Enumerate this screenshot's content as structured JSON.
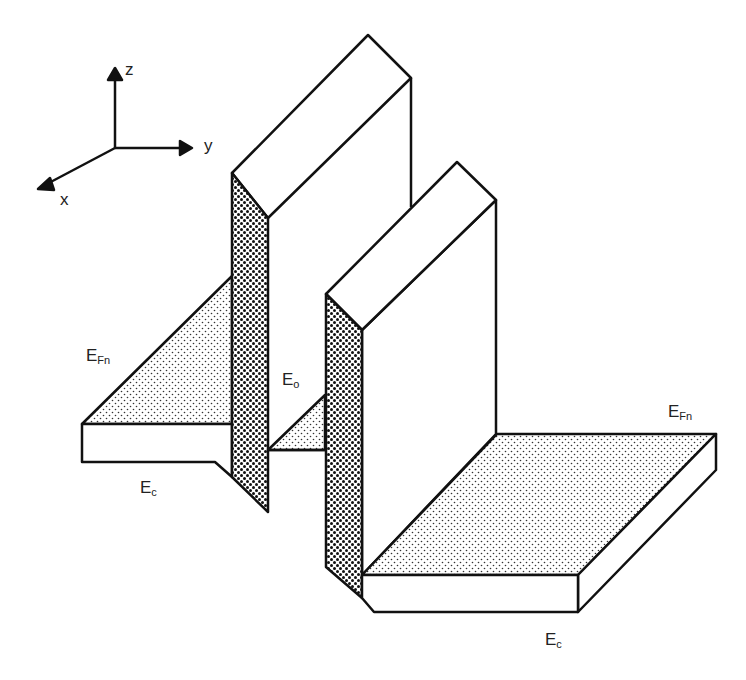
{
  "axes": {
    "z": "z",
    "y": "y",
    "x": "x"
  },
  "labels": {
    "efn_left": {
      "main": "E",
      "sub": "Fn"
    },
    "ec_left": {
      "main": "E",
      "sub": "c"
    },
    "eo": {
      "main": "E",
      "sub": "o"
    },
    "efn_right": {
      "main": "E",
      "sub": "Fn"
    },
    "ec_right": {
      "main": "E",
      "sub": "c"
    }
  },
  "colors": {
    "stroke": "#111111",
    "fill": "#ffffff"
  }
}
